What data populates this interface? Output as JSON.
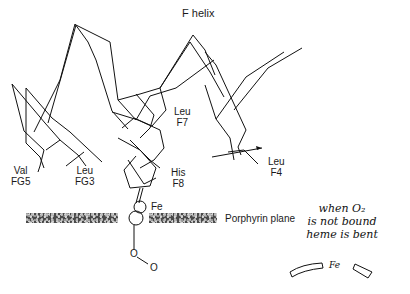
{
  "diagram": {
    "title": "F helix",
    "labels": {
      "leu_f7": {
        "line1": "Leu",
        "line2": "F7"
      },
      "val_fg5": {
        "line1": "Val",
        "line2": "FG5"
      },
      "leu_fg3": {
        "line1": "Leu",
        "line2": "FG3"
      },
      "his_f8": {
        "line1": "His",
        "line2": "F8"
      },
      "leu_f4": {
        "line1": "Leu",
        "line2": "F4"
      },
      "fe": "Fe",
      "porphyrin_plane": "Porphyrin plane",
      "oxygen_1": "O",
      "oxygen_2": "O"
    },
    "handwritten_note": {
      "line1": "when O₂",
      "line2": "is not bound",
      "line3": "heme is bent",
      "sketch_label": "Fe"
    },
    "colors": {
      "line": "#111111",
      "plane": "#4a4a4a",
      "background": "#ffffff"
    }
  }
}
